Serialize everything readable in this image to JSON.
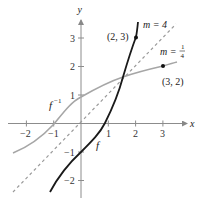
{
  "figure": {
    "axes": {
      "x_label": "x",
      "y_label": "y",
      "x_ticks": [
        "−2",
        "−1",
        "1",
        "2",
        "3"
      ],
      "y_ticks": [
        "3",
        "2",
        "1",
        "−1",
        "−2"
      ]
    },
    "curves": {
      "f": {
        "label": "f",
        "color": "#1a1a1a"
      },
      "f_inverse": {
        "label": "f",
        "sup": "−1",
        "color": "#a6a6a6"
      },
      "identity": {
        "style": "dashed",
        "color": "#9a9a9a"
      }
    },
    "points": [
      {
        "label": "(2, 3)",
        "x": 2,
        "y": 3
      },
      {
        "label": "(3, 2)",
        "x": 3,
        "y": 2
      }
    ],
    "slope_labels": {
      "m4": "m = 4",
      "m_quarter_prefix": "m = ",
      "m_quarter_num": "1",
      "m_quarter_den": "4"
    }
  }
}
